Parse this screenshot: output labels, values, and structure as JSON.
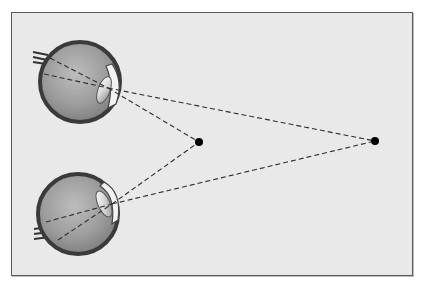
{
  "figure": {
    "background_color": "#e9e9e9",
    "border_color": "#5a5a5a",
    "elements": {
      "eyes": [
        {
          "id": "top-eye",
          "label": "",
          "center": [
            80,
            82
          ],
          "radius": 40
        },
        {
          "id": "bottom-eye",
          "label": "",
          "center": [
            78,
            214
          ],
          "radius": 40
        }
      ],
      "targets": [
        {
          "id": "near-point",
          "label": "",
          "position": [
            199,
            142
          ]
        },
        {
          "id": "far-point",
          "label": "",
          "position": [
            375,
            141
          ]
        }
      ],
      "line_style": "dashed",
      "line_color": "#333333"
    }
  }
}
